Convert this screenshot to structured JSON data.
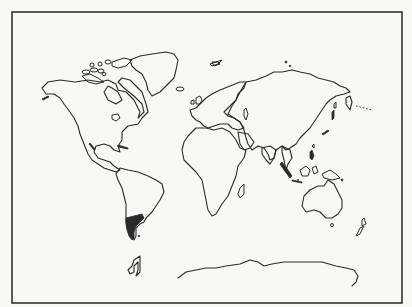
{
  "map": {
    "type": "outline world map",
    "projection": "equirectangular-like",
    "highlighted_region": {
      "name": "Southern South America (Patagonia: southern Chile / Argentina)",
      "fill_color": "#2a2a2a"
    },
    "colors": {
      "background": "#f8f8f6",
      "outline": "#2a2a2a",
      "frame": "#333333"
    },
    "continents": [
      "North America",
      "Greenland",
      "South America",
      "Europe",
      "Africa",
      "Asia",
      "Australia",
      "Antarctica",
      "New Zealand"
    ]
  }
}
